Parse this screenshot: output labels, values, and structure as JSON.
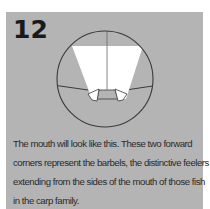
{
  "step": {
    "number": "12"
  },
  "caption": {
    "lines": [
      "The mouth will look like this. These two forward",
      "corners represent the barbels, the distinctive feelers",
      "extending from the sides of the mouth of those fish",
      "in the carp family."
    ]
  },
  "colors": {
    "panel_background": "#b4b4b4",
    "page_background": "#ffffff",
    "paper": "#ffffff",
    "line": "#3a3a3a",
    "text": "#2a2a2a"
  },
  "diagram": {
    "icon": "origami-mouth-diagram"
  }
}
